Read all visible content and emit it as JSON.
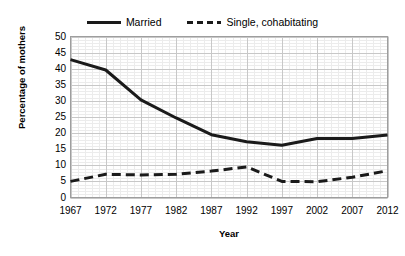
{
  "chart_data": {
    "type": "line",
    "title": "",
    "xlabel": "Year",
    "ylabel": "Percentage of mothers",
    "x": [
      1967,
      1972,
      1977,
      1982,
      1987,
      1992,
      1997,
      2002,
      2007,
      2012
    ],
    "categories": [
      "1967",
      "1972",
      "1977",
      "1982",
      "1987",
      "1992",
      "1997",
      "2002",
      "2007",
      "2012"
    ],
    "xlim": [
      1967,
      2012
    ],
    "ylim": [
      0,
      50
    ],
    "ytick_step": 5,
    "yticks": [
      "50",
      "45",
      "40",
      "35",
      "30",
      "25",
      "20",
      "15",
      "10",
      "5",
      "0"
    ],
    "grid": true,
    "minor_grid": true,
    "legend_position": "top-center",
    "series": [
      {
        "name": "Married",
        "style": "solid",
        "color": "#1a1a1a",
        "values": [
          42.8,
          39.6,
          30.3,
          24.7,
          19.5,
          17.3,
          16.2,
          18.3,
          18.3,
          19.4
        ]
      },
      {
        "name": "Single, cohabitating",
        "style": "dashed",
        "color": "#1a1a1a",
        "values": [
          5.0,
          7.2,
          7.0,
          7.2,
          8.2,
          9.5,
          5.0,
          4.9,
          6.3,
          8.3
        ]
      }
    ]
  },
  "legend": {
    "entries": [
      {
        "label": "Married",
        "swatch": "solid-line-swatch"
      },
      {
        "label": "Single, cohabitating",
        "swatch": "dashed-line-swatch"
      }
    ]
  },
  "axes": {
    "y_title": "Percentage of mothers",
    "x_title": "Year"
  },
  "colors": {
    "line": "#1a1a1a",
    "plot_border": "#9e9e9e",
    "major_grid": "#c8c8c8",
    "minor_grid": "#ececec",
    "background": "#ffffff",
    "text": "#000000"
  }
}
